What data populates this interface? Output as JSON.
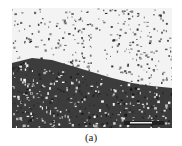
{
  "figure": {
    "caption": "(a)",
    "panel_type": "micrograph",
    "scale_bar": {
      "present": true,
      "label_legible": false
    },
    "regions": [
      {
        "name": "sparse-particles",
        "tone": "light",
        "color": "#f2f2f2"
      },
      {
        "name": "dense-particles",
        "tone": "dark",
        "color": "#3a3a3a"
      }
    ]
  }
}
